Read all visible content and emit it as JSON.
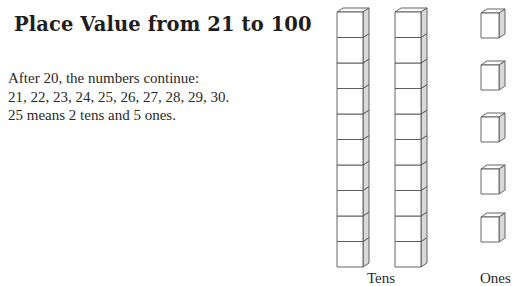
{
  "title": "Place Value from 21 to 100",
  "paragraph": {
    "line1": "After 20, the numbers continue:",
    "line2": "21, 22, 23, 24, 25, 26, 27, 28, 29, 30.",
    "line3": "25 means 2 tens and 5 ones."
  },
  "figure": {
    "tens_label": "Tens",
    "ones_label": "Ones",
    "tens_rods": 2,
    "cubes_per_rod": 10,
    "ones_cubes": 5,
    "colors": {
      "stroke": "#555555",
      "side_fill": "#d9d9d9",
      "front_fill": "#ffffff"
    }
  }
}
